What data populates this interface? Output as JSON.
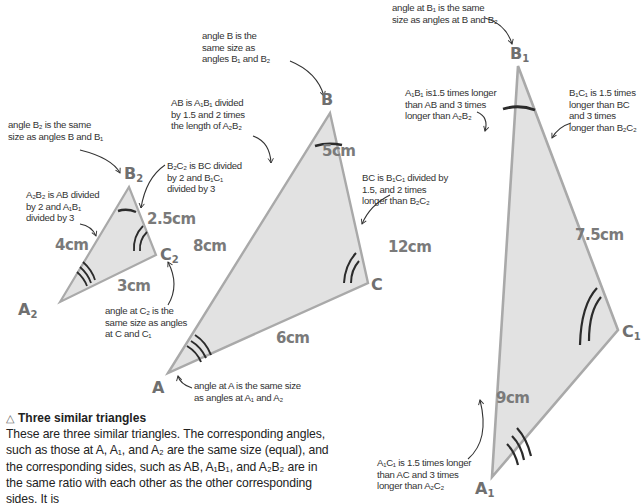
{
  "colors": {
    "triangle_fill": "#e2e2e2",
    "triangle_stroke": "#a9a9a9",
    "angle_mark": "#2b2b2b",
    "measure_text": "#7a7a7a",
    "label_text": "#6f6f6f",
    "note_text": "#333333"
  },
  "triangles": {
    "small": {
      "vertices": {
        "A": "A",
        "A_sub": "2",
        "B": "B",
        "B_sub": "2",
        "C": "C",
        "C_sub": "2"
      },
      "sides": {
        "AB": "4cm",
        "BC": "2.5cm",
        "AC": "3cm"
      }
    },
    "middle": {
      "vertices": {
        "A": "A",
        "B": "B",
        "C": "C"
      },
      "sides": {
        "AB": "8cm",
        "BC": "5cm",
        "AC": "6cm"
      }
    },
    "large": {
      "vertices": {
        "A": "A",
        "A_sub": "1",
        "B": "B",
        "B_sub": "1",
        "C": "C",
        "C_sub": "1"
      },
      "sides": {
        "AB": "12cm",
        "BC": "7.5cm",
        "AC": "9cm"
      }
    }
  },
  "annotations": {
    "angle_b2": "angle B₂ is the same\nsize as angles B and B₁",
    "a2b2": "A₂B₂ is AB divided\nby 2 and A₁B₁\ndivided by 3",
    "b2c2": "B₂C₂ is BC divided\nby 2 and B₁C₁\ndivided by 3",
    "angle_c2": "angle at C₂ is the\nsame size as angles\nat C and C₁",
    "angle_b": "angle B is the\nsame size as\nangles B₁ and B₂",
    "ab": "AB is A₁B₁ divided\nby 1.5 and 2 times\nthe length of A₂B₂",
    "bc": "BC is B₁C₁ divided by\n1.5, and 2 times\nlonger than B₂C₂",
    "angle_a": "angle at A is the same size\nas angles at A₁ and A₂",
    "angle_b1": "angle at B₁ is the same\nsize as angles at B and B₂",
    "a1b1": "A₁B₁ is1.5 times longer\nthan AB and 3 times\nlonger than A₂B₂",
    "b1c1": "B₁C₁ is 1.5 times\nlonger than BC\nand 3 times\nlonger than B₂C₂",
    "a1c1": "A₁C₁ is 1.5 times longer\nthan AC and 3 times\nlonger than A₂C₂"
  },
  "caption": {
    "icon": "triangle-outline-icon",
    "icon_glyph": "△",
    "title": "Three similar triangles",
    "body": "These are three similar triangles. The corresponding angles, such as those at A, A₁, and A₂ are the same size (equal), and the corresponding sides, such as AB, A₁B₁, and A₂B₂ are in the same ratio with each other as the other corresponding sides. It is"
  }
}
